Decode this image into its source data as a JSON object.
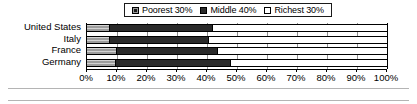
{
  "chart_data": {
    "type": "bar",
    "orientation": "horizontal",
    "stacked": true,
    "normalized_percent": true,
    "title": "",
    "subtitle": "",
    "xlabel": "",
    "ylabel": "",
    "xlim": [
      0,
      100
    ],
    "grid": true,
    "legend_position": "top-center",
    "categories": [
      "United States",
      "Italy",
      "France",
      "Germany"
    ],
    "xticks": [
      0,
      10,
      20,
      30,
      40,
      50,
      60,
      70,
      80,
      90,
      100
    ],
    "xticklabels": [
      "0%",
      "10%",
      "20%",
      "30%",
      "40%",
      "50%",
      "60%",
      "70%",
      "80%",
      "90%",
      "100%"
    ],
    "series": [
      {
        "name": "Poorest 30%",
        "swatch": "poorest",
        "color": "#9d9d9d",
        "values": [
          7.5,
          7.5,
          10.0,
          9.5
        ]
      },
      {
        "name": "Middle 40%",
        "swatch": "middle",
        "color": "#2a2a2a",
        "values": [
          34.5,
          33.0,
          33.5,
          38.5
        ]
      },
      {
        "name": "Richest 30%",
        "swatch": "richest",
        "color": "#ffffff",
        "values": [
          58.0,
          59.5,
          56.5,
          52.0
        ]
      }
    ]
  },
  "legend": {
    "items": [
      {
        "label": "Poorest 30%",
        "swatch": "poorest"
      },
      {
        "label": "Middle 40%",
        "swatch": "middle"
      },
      {
        "label": "Richest 30%",
        "swatch": "richest"
      }
    ]
  },
  "axis": {
    "ticks": [
      {
        "label": "0%",
        "value": 0
      },
      {
        "label": "10%",
        "value": 10
      },
      {
        "label": "20%",
        "value": 20
      },
      {
        "label": "30%",
        "value": 30
      },
      {
        "label": "40%",
        "value": 40
      },
      {
        "label": "50%",
        "value": 50
      },
      {
        "label": "60%",
        "value": 60
      },
      {
        "label": "70%",
        "value": 70
      },
      {
        "label": "80%",
        "value": 80
      },
      {
        "label": "90%",
        "value": 90
      },
      {
        "label": "100%",
        "value": 100
      }
    ]
  },
  "colors": {
    "poorest": "#9d9d9d",
    "middle": "#2a2a2a",
    "richest": "#ffffff",
    "outline": "#000000",
    "gridline": "#8f8f8f",
    "rule": "#b4b4b4"
  }
}
